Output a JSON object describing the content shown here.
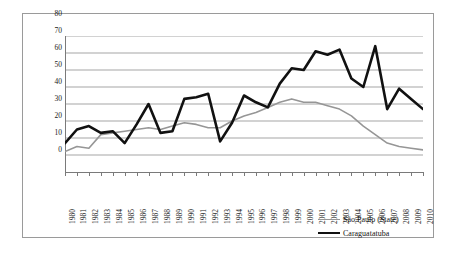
{
  "chart_data": {
    "type": "line",
    "title": "",
    "subtitle": "",
    "xlabel": "",
    "ylabel": "",
    "grid": true,
    "legend_position": "bottom-right",
    "ylim": [
      0,
      80
    ],
    "yticks": [
      0,
      10,
      20,
      30,
      40,
      50,
      60,
      70,
      80
    ],
    "categories": [
      "1980",
      "1981",
      "1982",
      "1983",
      "1984",
      "1985",
      "1986",
      "1987",
      "1988",
      "1989",
      "1990",
      "1991",
      "1992",
      "1993",
      "1994",
      "1995",
      "1996",
      "1997",
      "1998",
      "1999",
      "2000",
      "2001",
      "2002",
      "2003",
      "2004",
      "2005",
      "2006",
      "2007",
      "2008",
      "2009",
      "2010"
    ],
    "series": [
      {
        "name": "São Paulo (State)",
        "color": "#969696",
        "width": 1.6,
        "values": [
          12,
          15,
          14,
          22,
          23,
          24,
          25,
          26,
          25,
          27,
          29,
          28,
          26,
          26,
          30,
          33,
          35,
          38,
          41,
          43,
          41,
          41,
          39,
          37,
          33,
          27,
          22,
          17,
          15,
          14,
          13
        ]
      },
      {
        "name": "Caraguatatuba",
        "color": "#111111",
        "width": 2.6,
        "values": [
          17,
          25,
          27,
          23,
          24,
          17,
          28,
          40,
          23,
          24,
          43,
          44,
          46,
          18,
          29,
          45,
          41,
          38,
          52,
          61,
          60,
          71,
          69,
          72,
          55,
          50,
          74,
          37,
          49,
          43,
          37
        ]
      }
    ]
  },
  "legend": {
    "entries": [
      {
        "label": "São Paulo (State)"
      },
      {
        "label": "Caraguatatuba"
      }
    ]
  }
}
